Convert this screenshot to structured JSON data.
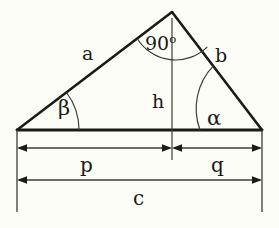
{
  "figure": {
    "background_color": "#fdfdf7",
    "stroke_color": "#1a1a18",
    "labels": {
      "side_a": "a",
      "side_b": "b",
      "altitude_h": "h",
      "segment_p": "p",
      "segment_q": "q",
      "hypotenuse_c": "c",
      "angle_alpha": "α",
      "angle_beta": "β",
      "right_angle_value": "90",
      "right_angle_unit": "o"
    },
    "geometry": {
      "apex": {
        "x": 172,
        "y": 12
      },
      "base_left": {
        "x": 17,
        "y": 130
      },
      "base_right": {
        "x": 262,
        "y": 130
      },
      "foot_of_altitude": {
        "x": 172,
        "y": 130
      },
      "right_angle_degrees": 90,
      "dim_line_pq_y": 148,
      "dim_line_c_y": 180,
      "extension_line_bottom_y": 212
    }
  }
}
